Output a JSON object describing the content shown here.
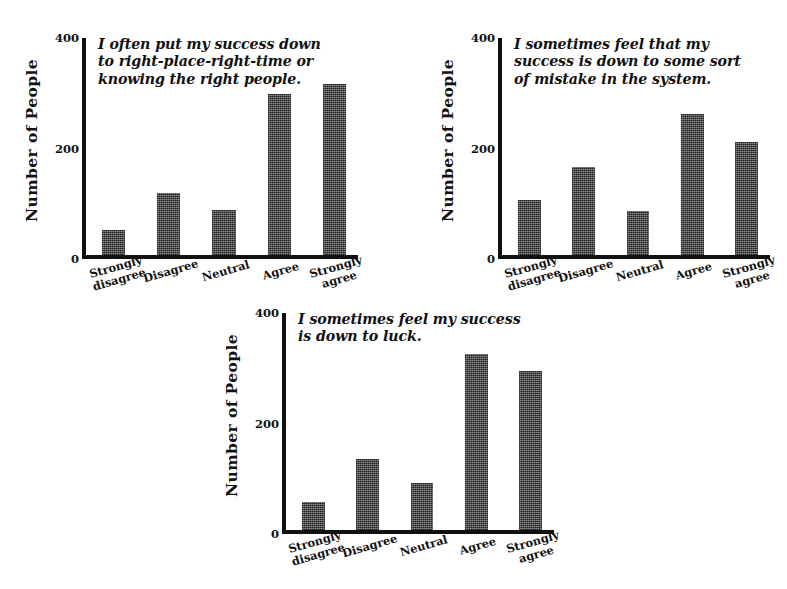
{
  "page": {
    "background": "#ffffff",
    "ink": "#111111",
    "bar_color": "#5a5a5a"
  },
  "axis": {
    "ylabel": "Number of People",
    "yticks": [
      "0",
      "200",
      "400"
    ],
    "ytick_values": [
      0,
      200,
      400
    ],
    "ylim": [
      0,
      400
    ],
    "categories": [
      "Strongly\ndisagree",
      "Disagree",
      "Neutral",
      "Agree",
      "Strongly\nagree"
    ]
  },
  "charts": [
    {
      "id": "chart-right-place-right-time",
      "title": "I often put my success down\nto right-place-right-time or\nknowing the right people.",
      "values": [
        46,
        113,
        81,
        291,
        310
      ]
    },
    {
      "id": "chart-mistake-in-the-system",
      "title": "I sometimes feel that my\nsuccess is down to some sort\nof mistake in the system.",
      "values": [
        100,
        160,
        80,
        255,
        205
      ]
    },
    {
      "id": "chart-down-to-luck",
      "title": "I sometimes feel my success\nis down to luck.",
      "values": [
        51,
        128,
        85,
        318,
        287
      ]
    }
  ],
  "chart_data": [
    {
      "type": "bar",
      "title": "I often put my success down to right-place-right-time or knowing the right people.",
      "xlabel": "",
      "ylabel": "Number of People",
      "categories": [
        "Strongly disagree",
        "Disagree",
        "Neutral",
        "Agree",
        "Strongly agree"
      ],
      "values": [
        46,
        113,
        81,
        291,
        310
      ],
      "ylim": [
        0,
        400
      ],
      "yticks": [
        0,
        200,
        400
      ],
      "grid": false,
      "legend": "none"
    },
    {
      "type": "bar",
      "title": "I sometimes feel that my success is down to some sort of mistake in the system.",
      "xlabel": "",
      "ylabel": "Number of People",
      "categories": [
        "Strongly disagree",
        "Disagree",
        "Neutral",
        "Agree",
        "Strongly agree"
      ],
      "values": [
        100,
        160,
        80,
        255,
        205
      ],
      "ylim": [
        0,
        400
      ],
      "yticks": [
        0,
        200,
        400
      ],
      "grid": false,
      "legend": "none"
    },
    {
      "type": "bar",
      "title": "I sometimes feel my success is down to luck.",
      "xlabel": "",
      "ylabel": "Number of People",
      "categories": [
        "Strongly disagree",
        "Disagree",
        "Neutral",
        "Agree",
        "Strongly agree"
      ],
      "values": [
        51,
        128,
        85,
        318,
        287
      ],
      "ylim": [
        0,
        400
      ],
      "yticks": [
        0,
        200,
        400
      ],
      "grid": false,
      "legend": "none"
    }
  ]
}
